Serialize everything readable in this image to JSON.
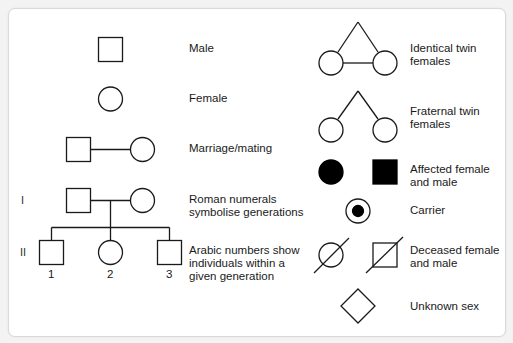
{
  "diagram": {
    "stroke_color": "#1a1a1a",
    "fill_affected": "#000000",
    "background": "#ffffff",
    "legend_left": [
      {
        "symbol": "square",
        "label": "Male"
      },
      {
        "symbol": "circle",
        "label": "Female"
      },
      {
        "symbol": "square-line-circle",
        "label": "Marriage/mating"
      },
      {
        "symbol": "generation-I",
        "label": "Roman numerals symbolise generations"
      },
      {
        "symbol": "generation-II",
        "label": "Arabic numbers show individuals within a given generation"
      }
    ],
    "legend_right": [
      {
        "symbol": "identical-twins",
        "label": "Identical twin females"
      },
      {
        "symbol": "fraternal-twins",
        "label": "Fraternal twin females"
      },
      {
        "symbol": "affected",
        "label": "Affected female and male"
      },
      {
        "symbol": "carrier",
        "label": "Carrier"
      },
      {
        "symbol": "deceased",
        "label": "Deceased female and male"
      },
      {
        "symbol": "diamond",
        "label": "Unknown sex"
      }
    ],
    "generations": [
      "I",
      "II"
    ],
    "individuals": [
      "1",
      "2",
      "3"
    ]
  },
  "labels": {
    "male": "Male",
    "female": "Female",
    "marriage": "Marriage/mating",
    "roman_1": "Roman numerals",
    "roman_2": "symbolise generations",
    "arabic_1": "Arabic numbers show",
    "arabic_2": "individuals within a",
    "arabic_3": "given generation",
    "identical_1": "Identical twin",
    "identical_2": "females",
    "fraternal_1": "Fraternal twin",
    "fraternal_2": "females",
    "affected_1": "Affected female",
    "affected_2": "and male",
    "carrier": "Carrier",
    "deceased_1": "Deceased female",
    "deceased_2": "and male",
    "unknown": "Unknown sex",
    "gen_I": "I",
    "gen_II": "II",
    "ind_1": "1",
    "ind_2": "2",
    "ind_3": "3"
  }
}
